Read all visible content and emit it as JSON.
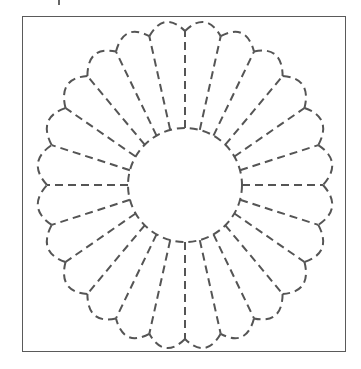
{
  "figure": {
    "stroke_color": "#555555",
    "frame_color": "#5a5a5a",
    "dash_pattern": "8 5",
    "stroke_width": 2
  },
  "pattern": {
    "center": [
      185,
      185
    ],
    "inner_circle_radius": 57,
    "petal_count": 24,
    "junction_radius_x": 138,
    "junction_radius_y": 154,
    "petal_bulge": 11,
    "start_angle_deg": 0
  }
}
